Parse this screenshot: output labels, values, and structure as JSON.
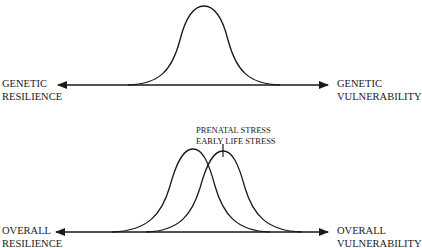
{
  "top_panel": {
    "left_label": [
      "GENETIC",
      "RESILIENCE"
    ],
    "right_label": [
      "GENETIC",
      "VULNERABILITY"
    ],
    "curve": {
      "peak_x": 204,
      "peak_y": 6,
      "baseline_y": 85,
      "start_x": 130,
      "end_x": 278
    }
  },
  "bottom_panel": {
    "left_label": [
      "OVERALL",
      "RESILIENCE"
    ],
    "right_label": [
      "OVERALL",
      "VULNERABILITY"
    ],
    "annotation": [
      "PRENATAL STRESS",
      "EARLY LIFE STRESS"
    ],
    "curves": [
      {
        "name": "baseline",
        "peak_x": 193,
        "peak_y": 149
      },
      {
        "name": "shifted",
        "peak_x": 223,
        "peak_y": 151
      }
    ]
  },
  "colors": {
    "line": "#1a1a1a",
    "background": "#ffffff"
  }
}
